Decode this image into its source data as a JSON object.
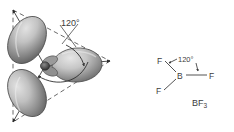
{
  "figure": {
    "background_color": "#ffffff"
  },
  "orbital_diagram": {
    "name": "sp2 hybrid orbital lobes trigonal planar",
    "angle_label": "120°",
    "lobe_count": 3,
    "lobe_fill_light": "#d4d4d4",
    "lobe_fill_dark": "#6f6f6f",
    "outline_color": "#4a4a4a",
    "dashed_triangle_color": "#555555",
    "axis_color": "#2e2e2e",
    "lobes": [
      {
        "id": "lobe-upper-left",
        "direction_deg": 120
      },
      {
        "id": "lobe-right",
        "direction_deg": 0
      },
      {
        "id": "lobe-lower-left",
        "direction_deg": 240
      }
    ]
  },
  "lewis_structure": {
    "name": "BF3 structural formula",
    "central_atom": "B",
    "angle_label": "120°",
    "atoms": [
      {
        "id": "f-top-left",
        "label": "F"
      },
      {
        "id": "f-right",
        "label": "F"
      },
      {
        "id": "f-bottom-left",
        "label": "F"
      }
    ],
    "bond_color": "#4a4a4a",
    "formula": "BF",
    "formula_subscript": "3"
  }
}
